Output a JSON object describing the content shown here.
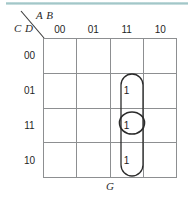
{
  "diagram": {
    "kind": "karnaugh-map",
    "row_axis_label": "C D",
    "col_axis_label": "A B",
    "output_label": "G",
    "col_headers": [
      "00",
      "01",
      "11",
      "10"
    ],
    "row_headers": [
      "00",
      "01",
      "11",
      "10"
    ],
    "cells": [
      [
        "",
        "",
        "",
        ""
      ],
      [
        "",
        "",
        "1",
        ""
      ],
      [
        "",
        "",
        "1",
        ""
      ],
      [
        "",
        "",
        "1",
        ""
      ]
    ],
    "groups": [
      {
        "name": "vertical-group-column-11",
        "shape": "rounded-rect",
        "cells": "rows 01,11,10 of column 11"
      },
      {
        "name": "single-cell-group-row-11",
        "shape": "ellipse",
        "cells": "row 11 of column 11"
      }
    ],
    "colors": {
      "grid_line": "#8d8f91",
      "group_outline": "#2b2b2b",
      "text": "#1b1b1b",
      "top_rule": "#9dc3c5"
    }
  }
}
